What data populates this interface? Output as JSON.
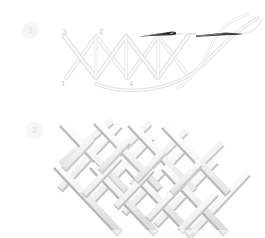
{
  "page": {
    "background_color": "#ffffff",
    "width": 265,
    "height": 238
  },
  "palette": {
    "thread_light": "#f2f2f2",
    "thread_mid": "#e4e4e4",
    "thread_shadow": "#cfcfcf",
    "ribbon_face": "#fbfbfb",
    "ribbon_side": "#bdbdbd",
    "ribbon_edge": "#d6d6d6",
    "needle_dark": "#3c3c3c",
    "needle_mid": "#8a8a8a",
    "label_text": "#c9c9c9",
    "badge_bg": "#f6f6f6",
    "badge_text": "#e2e2e2"
  },
  "steps": [
    {
      "number": "1",
      "badge_label": "1",
      "name": "form-crossed-stitches",
      "point_labels": [
        {
          "label": "3",
          "name": "stitch-point-3",
          "x": 62,
          "y": 27
        },
        {
          "label": "2",
          "name": "stitch-point-2",
          "x": 99,
          "y": 27
        },
        {
          "label": "1",
          "name": "stitch-point-1",
          "x": 61,
          "y": 79
        },
        {
          "label": "4",
          "name": "stitch-point-4",
          "x": 129,
          "y": 79
        }
      ],
      "needles": [
        {
          "name": "needle-left",
          "tip": "left",
          "x": 140,
          "y": 36
        },
        {
          "name": "needle-right",
          "tip": "right",
          "x": 198,
          "y": 35
        }
      ],
      "thread_count": 2
    },
    {
      "number": "2",
      "badge_label": "2",
      "name": "completed-woven-lattice",
      "rows": 2,
      "columns": 4,
      "description_visible": false
    }
  ]
}
